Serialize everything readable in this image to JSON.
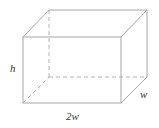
{
  "diagram": {
    "type": "rectangular-prism",
    "labels": {
      "height": "h",
      "depth": "w",
      "length": "2w"
    },
    "colors": {
      "edge": "#a6a6a6",
      "label": "#333333"
    }
  }
}
